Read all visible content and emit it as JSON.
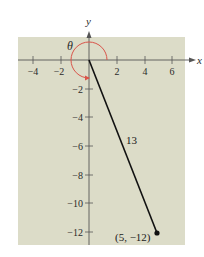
{
  "figure": {
    "background_color": "#dcdcc8",
    "axis_color": "#555555",
    "arc_color": "#d9544a",
    "segment_color": "#111111",
    "x_axis": {
      "name": "x",
      "ticks": [
        "−4",
        "−2",
        "2",
        "4",
        "6"
      ],
      "tick_values": [
        -4,
        -2,
        2,
        4,
        6
      ]
    },
    "y_axis": {
      "name": "y",
      "ticks": [
        "−2",
        "−4",
        "−6",
        "−8",
        "−10",
        "−12"
      ],
      "tick_values": [
        -2,
        -4,
        -6,
        -8,
        -10,
        -12
      ]
    },
    "angle_label": "θ",
    "segment_length_label": "13",
    "point_label": "(5, −12)",
    "point": {
      "x": 5,
      "y": -12
    }
  }
}
